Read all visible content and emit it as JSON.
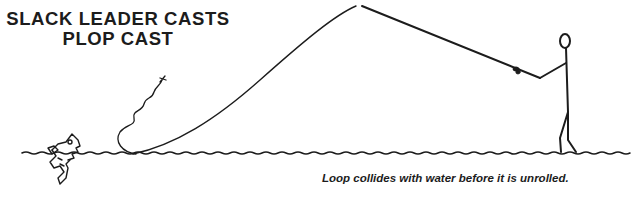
{
  "figure": {
    "title_line1": "SLACK LEADER CASTS",
    "title_line2": "PLOP CAST",
    "caption": "Loop collides with water before it is unrolled.",
    "elements": [
      "fly-line",
      "leader",
      "fly",
      "water-surface",
      "fish",
      "angler-stick-figure",
      "fishing-rod",
      "reel"
    ],
    "ink_color": "#1c1c1c",
    "background_color": "#ffffff"
  }
}
